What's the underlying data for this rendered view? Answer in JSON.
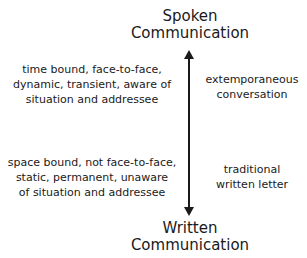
{
  "top_pole": {
    "line1": "Spoken",
    "line2": "Communication"
  },
  "bottom_pole": {
    "line1": "Written",
    "line2": "Communication"
  },
  "left_top_description": {
    "lines": [
      "time bound, face-to-face,",
      "dynamic, transient, aware of",
      "situation and addressee"
    ]
  },
  "left_bottom_description": {
    "lines": [
      "space bound, not face-to-face,",
      "static, permanent, unaware",
      "of situation and addressee"
    ]
  },
  "right_top_example": {
    "lines": [
      "extemporaneous",
      "conversation"
    ]
  },
  "right_bottom_example": {
    "lines": [
      "traditional",
      "written letter"
    ]
  },
  "arrow": {
    "type": "double-headed-vertical",
    "color": "#1a1a1a"
  }
}
